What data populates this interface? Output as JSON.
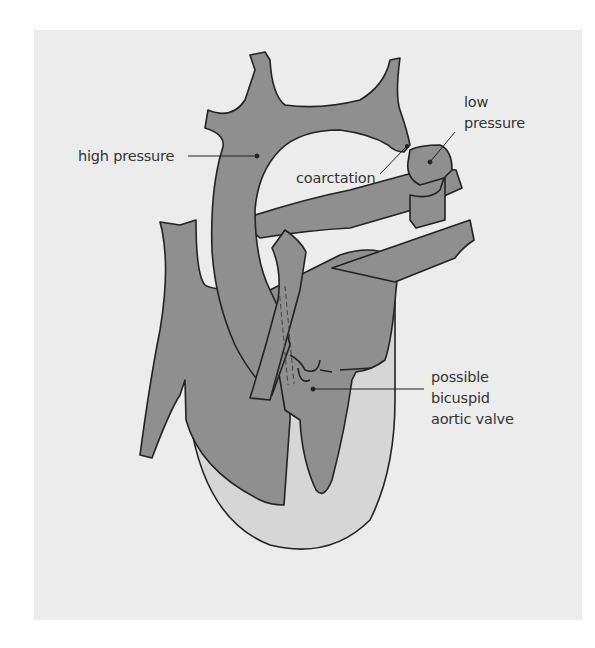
{
  "diagram": {
    "colors": {
      "background": "#ececec",
      "vessel_fill": "#8f8f8f",
      "chamber_light": "#d6d6d6",
      "outline": "#222222"
    },
    "labels": {
      "high_pressure": "high pressure",
      "low_pressure_line1": "low",
      "low_pressure_line2": "pressure",
      "coarctation": "coarctation",
      "valve_line1": "possible",
      "valve_line2": "bicuspid",
      "valve_line3": "aortic valve"
    }
  }
}
